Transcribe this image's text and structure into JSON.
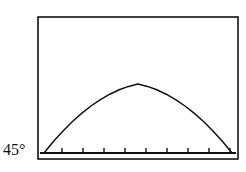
{
  "figure": {
    "type": "projectile-trajectory-plot",
    "background_color": "#ffffff",
    "ink_color": "#111111",
    "annotation_label": "45°"
  },
  "frame": {
    "x": 38,
    "y": 17,
    "width": 200,
    "height": 142,
    "stroke_width": 1.6,
    "color": "#111111"
  },
  "axis": {
    "baseline_y": 153,
    "x_start": 40,
    "x_end": 236,
    "stroke_width": 1.8,
    "tick_count": 9,
    "tick_length": 4,
    "tick_color": "#111111",
    "tick_positions": [
      62,
      83,
      104,
      125,
      146,
      167,
      188,
      209,
      230
    ]
  },
  "chart_data": {
    "type": "line",
    "title": "",
    "xlabel": "",
    "ylabel": "",
    "grid": false,
    "legend": "none",
    "annotations": [
      {
        "text": "45°",
        "x": 3,
        "y": 152,
        "describes": "launch angle of projectile"
      }
    ],
    "launch_angle_degrees": 45,
    "xlim": [
      44,
      232
    ],
    "ylim": [
      33,
      153
    ],
    "series": [
      {
        "name": "trajectory",
        "color": "#111111",
        "stroke_width": 1.5,
        "x": [
          44,
          53.4,
          62.8,
          72.2,
          81.6,
          91,
          100.4,
          109.8,
          119.2,
          128.6,
          138,
          147.4,
          156.8,
          166.2,
          175.6,
          185,
          194.4,
          203.8,
          213.2,
          222.6,
          232
        ],
        "y": [
          153,
          141.6,
          131.2,
          121.8,
          113.4,
          106,
          99.6,
          94.2,
          89.8,
          86.4,
          84,
          86.4,
          89.8,
          94.2,
          99.6,
          106,
          113.4,
          121.8,
          131.2,
          141.6,
          153
        ]
      }
    ]
  }
}
